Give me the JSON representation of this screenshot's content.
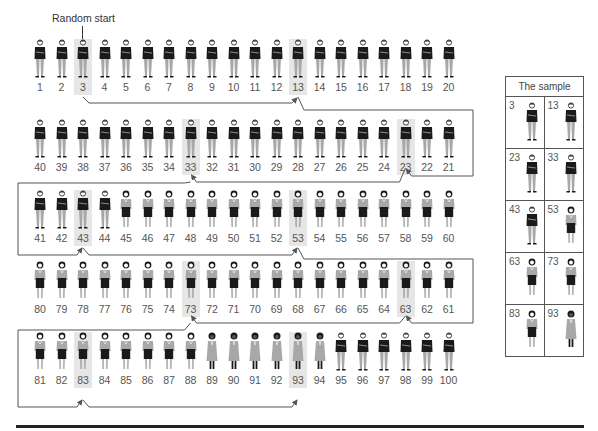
{
  "diagram": {
    "random_start_label": "Random start",
    "interval": 10,
    "population_size": 100,
    "sample_box_title": "The sample",
    "colors": {
      "highlight": "#e6e6e6",
      "dark": "#1a1a1a",
      "gray": "#a8a8a8",
      "line": "#555555"
    },
    "figure_types": {
      "man": "dark jacket, gray trousers",
      "woman_skirt": "gray blouse, black skirt",
      "woman_coat": "dark hair, gray coat"
    },
    "rows": [
      {
        "direction": "ltr",
        "numbers": [
          1,
          2,
          3,
          4,
          5,
          6,
          7,
          8,
          9,
          10,
          11,
          12,
          13,
          14,
          15,
          16,
          17,
          18,
          19,
          20
        ],
        "highlighted": [
          3,
          13
        ]
      },
      {
        "direction": "rtl",
        "numbers": [
          40,
          39,
          38,
          37,
          36,
          35,
          34,
          33,
          32,
          31,
          30,
          29,
          28,
          27,
          26,
          25,
          24,
          23,
          22,
          21
        ],
        "highlighted": [
          33,
          23
        ]
      },
      {
        "direction": "ltr",
        "numbers": [
          41,
          42,
          43,
          44,
          45,
          46,
          47,
          48,
          49,
          50,
          51,
          52,
          53,
          54,
          55,
          56,
          57,
          58,
          59,
          60
        ],
        "highlighted": [
          43,
          53
        ]
      },
      {
        "direction": "rtl",
        "numbers": [
          80,
          79,
          78,
          77,
          76,
          75,
          74,
          73,
          72,
          71,
          70,
          69,
          68,
          67,
          66,
          65,
          64,
          63,
          62,
          61
        ],
        "highlighted": [
          73,
          63
        ]
      },
      {
        "direction": "ltr",
        "numbers": [
          81,
          82,
          83,
          84,
          85,
          86,
          87,
          88,
          89,
          90,
          91,
          92,
          93,
          94,
          95,
          96,
          97,
          98,
          99,
          100
        ],
        "highlighted": [
          83,
          93
        ]
      }
    ],
    "population_types": {
      "man": "1-44,95-100",
      "woman_skirt": "45-88",
      "woman_coat": "89-94"
    },
    "sample": [
      {
        "number": "3",
        "type": "man"
      },
      {
        "number": "13",
        "type": "man"
      },
      {
        "number": "23",
        "type": "man"
      },
      {
        "number": "33",
        "type": "man"
      },
      {
        "number": "43",
        "type": "man"
      },
      {
        "number": "53",
        "type": "woman_skirt"
      },
      {
        "number": "63",
        "type": "woman_skirt"
      },
      {
        "number": "73",
        "type": "woman_skirt"
      },
      {
        "number": "83",
        "type": "woman_skirt"
      },
      {
        "number": "93",
        "type": "woman_coat"
      }
    ]
  }
}
